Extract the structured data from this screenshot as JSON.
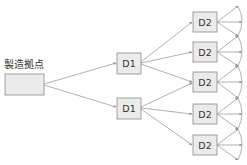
{
  "diagram": {
    "source": {
      "label": "製造拠点"
    },
    "tier1": [
      {
        "label": "D1"
      },
      {
        "label": "D1"
      }
    ],
    "tier2": [
      {
        "label": "D2"
      },
      {
        "label": "D2"
      },
      {
        "label": "D2"
      },
      {
        "label": "D2"
      },
      {
        "label": "D2"
      }
    ],
    "colors": {
      "box_fill": "#ebebeb",
      "box_stroke": "#8a8a8a",
      "edge": "#8f8f8f"
    }
  }
}
